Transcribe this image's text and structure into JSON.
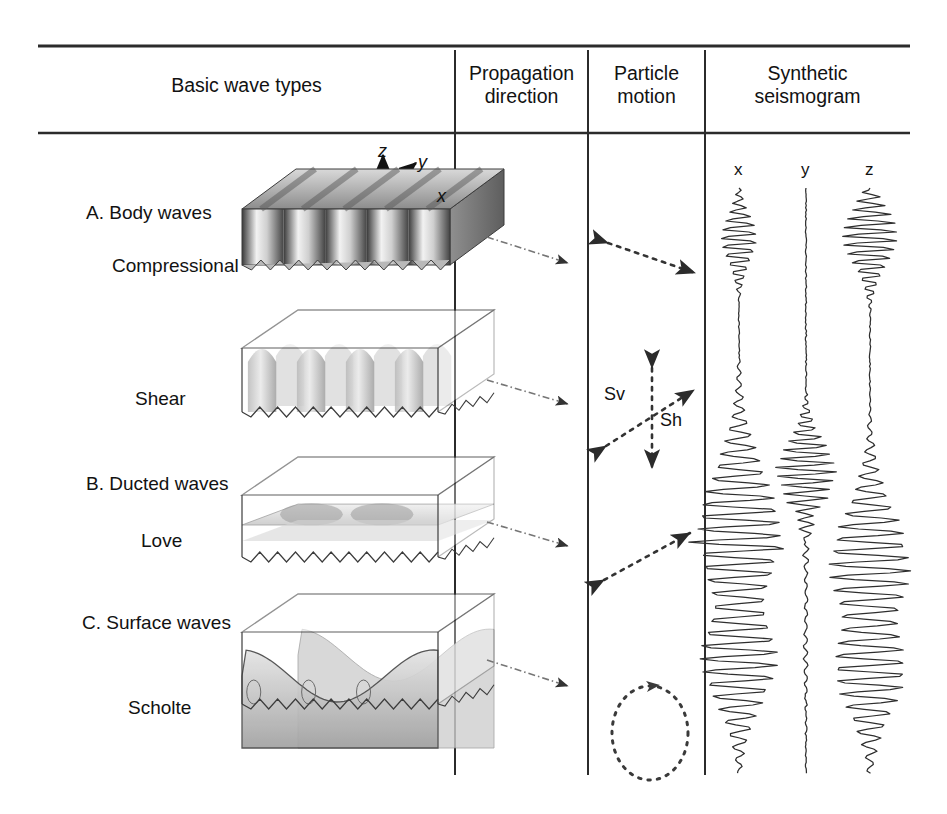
{
  "figure": {
    "type": "seismic-wave-types-table",
    "background": "#ffffff",
    "line_color": "#2b2b2b"
  },
  "table": {
    "headers": [
      {
        "id": "basic-wave-types",
        "label": "Basic wave types"
      },
      {
        "id": "propagation-direction",
        "label": "Propagation\ndirection"
      },
      {
        "id": "particle-motion",
        "label": "Particle\nmotion"
      },
      {
        "id": "synthetic-seismogram",
        "label": "Synthetic\nseismogram"
      }
    ],
    "column_x": [
      38,
      455,
      588,
      705,
      910
    ],
    "header_rule_top_y": 46,
    "header_rule_bottom_y": 133,
    "divider_bottom_y": 775
  },
  "axes_triad": {
    "origin": [
      383,
      191
    ],
    "labels": {
      "z": "z",
      "y": "y",
      "x": "x"
    }
  },
  "trace_headers": {
    "labels": [
      "x",
      "y",
      "z"
    ],
    "x_positions": [
      739,
      806,
      870
    ],
    "y": 170
  },
  "groups": [
    {
      "id": "group-a",
      "label": "A. Body waves",
      "x": 86,
      "y": 212
    },
    {
      "id": "group-b",
      "label": "B. Ducted waves",
      "x": 86,
      "y": 483
    },
    {
      "id": "group-c",
      "label": "C. Surface waves",
      "x": 82,
      "y": 622
    }
  ],
  "rows": [
    {
      "id": "compressional",
      "label": "Compressional",
      "label_x": 112,
      "label_y": 265,
      "block": {
        "cx": 370,
        "cy": 255,
        "style": "striped-solid-block"
      },
      "propagation": {
        "x1": 487,
        "y1": 237,
        "x2": 568,
        "y2": 263
      },
      "particle_motion": {
        "kind": "double-arrow",
        "x1": 608,
        "y1": 243,
        "x2": 695,
        "y2": 273,
        "annotations": []
      },
      "seismogram": {
        "traces": [
          {
            "axis": "x",
            "amplitude": "medium",
            "packet_y": 240,
            "packet_len": 60,
            "flat": false
          },
          {
            "axis": "y",
            "amplitude": "none",
            "packet_y": 250,
            "packet_len": 0,
            "flat": true
          },
          {
            "axis": "z",
            "amplitude": "large",
            "packet_y": 238,
            "packet_len": 70,
            "flat": false
          }
        ]
      }
    },
    {
      "id": "shear",
      "label": "Shear",
      "label_x": 135,
      "label_y": 398,
      "block": {
        "cx": 370,
        "cy": 400,
        "style": "translucent-box-columns"
      },
      "propagation": {
        "x1": 487,
        "y1": 380,
        "x2": 568,
        "y2": 404
      },
      "particle_motion": {
        "kind": "cross-double-arrows",
        "center": [
          652,
          418
        ],
        "annotations": [
          {
            "text": "Sv",
            "x": 604,
            "y": 394
          },
          {
            "text": "Sh",
            "x": 660,
            "y": 420
          }
        ]
      },
      "seismogram": {
        "traces": [
          {
            "axis": "x",
            "amplitude": "small",
            "packet_y": 545,
            "packet_len": 22,
            "flat": false
          },
          {
            "axis": "y",
            "amplitude": "large",
            "packet_y": 470,
            "packet_len": 75,
            "flat": false
          },
          {
            "axis": "z",
            "amplitude": "none",
            "packet_y": 480,
            "packet_len": 0,
            "flat": true
          }
        ]
      }
    },
    {
      "id": "love",
      "label": "Love",
      "label_x": 141,
      "label_y": 540,
      "block": {
        "cx": 370,
        "cy": 545,
        "style": "translucent-box-flat-wave"
      },
      "propagation": {
        "x1": 487,
        "y1": 522,
        "x2": 568,
        "y2": 546
      },
      "particle_motion": {
        "kind": "double-arrow",
        "x1": 604,
        "y1": 580,
        "x2": 690,
        "y2": 533,
        "annotations": []
      },
      "seismogram": {
        "traces": [
          {
            "axis": "x",
            "amplitude": "very-large",
            "packet_y": 545,
            "packet_len": 165,
            "flat": false
          },
          {
            "axis": "y",
            "amplitude": "tiny",
            "packet_y": 545,
            "packet_len": 160,
            "flat": false
          },
          {
            "axis": "z",
            "amplitude": "very-large",
            "packet_y": 580,
            "packet_len": 150,
            "flat": false
          }
        ]
      }
    },
    {
      "id": "scholte",
      "label": "Scholte",
      "label_x": 128,
      "label_y": 707,
      "block": {
        "cx": 370,
        "cy": 688,
        "style": "translucent-box-interface-wave"
      },
      "propagation": {
        "x1": 487,
        "y1": 660,
        "x2": 568,
        "y2": 686
      },
      "particle_motion": {
        "kind": "ellipse-ccw",
        "center": [
          650,
          733
        ],
        "rx": 38,
        "ry": 47,
        "annotations": []
      },
      "seismogram": {
        "traces": [
          {
            "axis": "x",
            "amplitude": "very-large",
            "packet_y": 650,
            "packet_len": 120,
            "flat": false
          },
          {
            "axis": "y",
            "amplitude": "tiny",
            "packet_y": 650,
            "packet_len": 100,
            "flat": false
          },
          {
            "axis": "z",
            "amplitude": "very-large",
            "packet_y": 660,
            "packet_len": 115,
            "flat": false
          }
        ]
      }
    }
  ]
}
